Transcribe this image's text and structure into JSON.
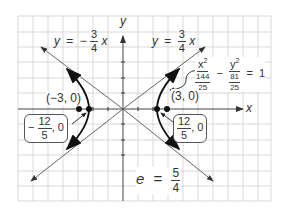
{
  "diagram": {
    "type": "hyperbola-graph",
    "grid": {
      "left": 18,
      "top": 16,
      "right": 271,
      "bottom": 201,
      "spacing": 15,
      "color": "#c8c8c8"
    },
    "origin_px": [
      123,
      109
    ],
    "axes": {
      "x_label": "x",
      "y_label": "y"
    },
    "asymptotes": [
      {
        "id": "neg",
        "label_y": "y",
        "label_eq": "=",
        "label_sign": "−",
        "label_num": "3",
        "label_den": "4",
        "label_x": "x"
      },
      {
        "id": "pos",
        "label_y": "y",
        "label_eq": "=",
        "label_sign": "",
        "label_num": "3",
        "label_den": "4",
        "label_x": "x"
      }
    ],
    "equation": {
      "x_term": "x",
      "x_exp": "2",
      "x_den_num": "144",
      "x_den_den": "25",
      "minus": "−",
      "y_term": "y",
      "y_exp": "2",
      "y_den_num": "81",
      "y_den_den": "25",
      "equals": "=",
      "rhs": "1"
    },
    "points": {
      "left_focus": "(−3, 0)",
      "right_focus": "(3, 0)",
      "left_vertex": {
        "sign": "−",
        "num": "12",
        "den": "5",
        "tail": ", 0"
      },
      "right_vertex": {
        "sign": "",
        "num": "12",
        "den": "5",
        "tail": ", 0"
      }
    },
    "eccentricity": {
      "symbol": "e",
      "equals": "=",
      "num": "5",
      "den": "4"
    }
  }
}
